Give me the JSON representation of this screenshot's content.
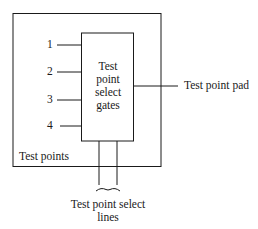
{
  "diagram": {
    "outer_box": {
      "label": "Test points"
    },
    "gate_box": {
      "lines": [
        "Test",
        "point",
        "select",
        "gates"
      ]
    },
    "inputs": [
      {
        "label": "1"
      },
      {
        "label": "2"
      },
      {
        "label": "3"
      },
      {
        "label": "4"
      }
    ],
    "output": {
      "label": "Test point pad"
    },
    "select_lines": {
      "line1": "Test point select",
      "line2": "lines"
    },
    "colors": {
      "stroke": "#1a1a1a",
      "background": "#ffffff"
    }
  }
}
